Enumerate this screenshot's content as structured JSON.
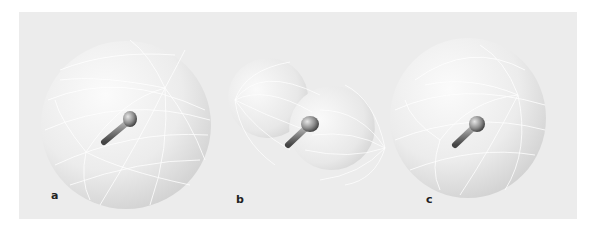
{
  "figure": {
    "background_color": "#ececec",
    "panels": [
      {
        "id": "a",
        "label": "a",
        "shape": "sphere",
        "description": "isotropic radiation pattern"
      },
      {
        "id": "b",
        "label": "b",
        "shape": "dipole-lobes",
        "description": "dipole radiation pattern (two lobes)"
      },
      {
        "id": "c",
        "label": "c",
        "shape": "sphere-dimpled",
        "description": "near-isotropic pattern"
      }
    ]
  }
}
